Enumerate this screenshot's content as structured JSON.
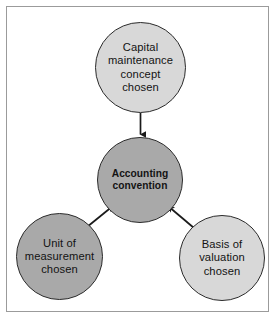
{
  "diagram": {
    "background_color": "#ffffff",
    "frame": {
      "border_color": "#9b9b9b",
      "name": "diagram-frame"
    },
    "nodes": [
      {
        "id": "capital-maintenance",
        "label": "Capital maintenance concept chosen",
        "lines": [
          "Capital",
          "maintenance",
          "concept",
          "chosen"
        ],
        "fill": "#d8d8d8",
        "stroke": "#2b2b2b",
        "bold": false
      },
      {
        "id": "accounting-convention",
        "label": "Accounting convention",
        "lines": [
          "Accounting",
          "convention"
        ],
        "fill": "#a9a9a9",
        "stroke": "#2b2b2b",
        "bold": true
      },
      {
        "id": "unit-of-measurement",
        "label": "Unit of measurement chosen",
        "lines": [
          "Unit of",
          "measurement",
          "chosen"
        ],
        "fill": "#a9a9a9",
        "stroke": "#2b2b2b",
        "bold": false
      },
      {
        "id": "basis-of-valuation",
        "label": "Basis of valuation chosen",
        "lines": [
          "Basis of",
          "valuation",
          "chosen"
        ],
        "fill": "#d8d8d8",
        "stroke": "#2b2b2b",
        "bold": false
      }
    ],
    "arrows": [
      {
        "id": "capital-to-accounting",
        "from": "capital-maintenance",
        "to": "accounting-convention",
        "direction": "down",
        "color": "#1a1a1a"
      },
      {
        "id": "unit-to-accounting",
        "from": "unit-of-measurement",
        "to": "accounting-convention",
        "direction": "up-right",
        "color": "#1a1a1a"
      },
      {
        "id": "basis-to-accounting",
        "from": "basis-of-valuation",
        "to": "accounting-convention",
        "direction": "up-left",
        "color": "#1a1a1a"
      }
    ]
  }
}
